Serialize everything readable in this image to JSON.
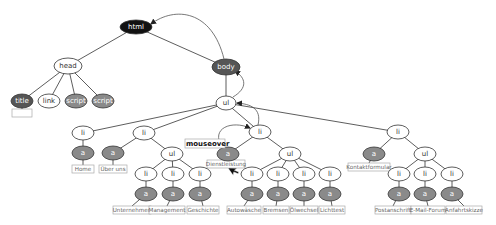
{
  "diagram": {
    "colors": {
      "black": "#111111",
      "dark": "#555555",
      "mid": "#8a8a8a",
      "light": "#ffffff",
      "edge": "#333333",
      "arrow": "#555555",
      "box_border": "#aaaaaa"
    },
    "nodes": [
      {
        "id": "html",
        "label": "html",
        "x": 136,
        "y": 27,
        "rx": 16,
        "ry": 7,
        "fill": "black"
      },
      {
        "id": "head",
        "label": "head",
        "x": 68,
        "y": 66,
        "rx": 14,
        "ry": 8,
        "fill": "light"
      },
      {
        "id": "body",
        "label": "body",
        "x": 226,
        "y": 67,
        "rx": 14,
        "ry": 8,
        "fill": "dark"
      },
      {
        "id": "title",
        "label": "title",
        "x": 22,
        "y": 101,
        "rx": 11,
        "ry": 7,
        "fill": "dark"
      },
      {
        "id": "link",
        "label": "link",
        "x": 49,
        "y": 101,
        "rx": 11,
        "ry": 7,
        "fill": "light"
      },
      {
        "id": "script1",
        "label": "script",
        "x": 76,
        "y": 101,
        "rx": 11,
        "ry": 7,
        "fill": "mid"
      },
      {
        "id": "script2",
        "label": "script",
        "x": 103,
        "y": 101,
        "rx": 11,
        "ry": 7,
        "fill": "mid"
      },
      {
        "id": "ul_main",
        "label": "ul",
        "x": 226,
        "y": 103,
        "rx": 10,
        "ry": 7,
        "fill": "light"
      },
      {
        "id": "li1",
        "label": "li",
        "x": 83,
        "y": 133,
        "rx": 11,
        "ry": 7,
        "fill": "light"
      },
      {
        "id": "li2",
        "label": "li",
        "x": 144,
        "y": 133,
        "rx": 11,
        "ry": 7,
        "fill": "light"
      },
      {
        "id": "li3",
        "label": "li",
        "x": 260,
        "y": 132,
        "rx": 11,
        "ry": 7,
        "fill": "light"
      },
      {
        "id": "li4",
        "label": "li",
        "x": 398,
        "y": 132,
        "rx": 11,
        "ry": 7,
        "fill": "light"
      },
      {
        "id": "a_home",
        "label": "a",
        "x": 83,
        "y": 153,
        "rx": 11,
        "ry": 7,
        "fill": "mid"
      },
      {
        "id": "a_ueber",
        "label": "a",
        "x": 113,
        "y": 153,
        "rx": 11,
        "ry": 7,
        "fill": "mid"
      },
      {
        "id": "ul2",
        "label": "ul",
        "x": 172,
        "y": 154,
        "rx": 11,
        "ry": 7,
        "fill": "light"
      },
      {
        "id": "a_dienst",
        "label": "a",
        "x": 228,
        "y": 154,
        "rx": 11,
        "ry": 7,
        "fill": "mid"
      },
      {
        "id": "ul3",
        "label": "ul",
        "x": 290,
        "y": 154,
        "rx": 11,
        "ry": 7,
        "fill": "light"
      },
      {
        "id": "a_kontakt",
        "label": "a",
        "x": 374,
        "y": 154,
        "rx": 11,
        "ry": 7,
        "fill": "mid"
      },
      {
        "id": "ul4",
        "label": "ul",
        "x": 425,
        "y": 154,
        "rx": 11,
        "ry": 7,
        "fill": "light"
      },
      {
        "id": "li_u1",
        "label": "li",
        "x": 146,
        "y": 174,
        "rx": 11,
        "ry": 7,
        "fill": "light"
      },
      {
        "id": "li_u2",
        "label": "li",
        "x": 173,
        "y": 174,
        "rx": 11,
        "ry": 7,
        "fill": "light"
      },
      {
        "id": "li_u3",
        "label": "li",
        "x": 200,
        "y": 174,
        "rx": 11,
        "ry": 7,
        "fill": "light"
      },
      {
        "id": "li_d1",
        "label": "li",
        "x": 252,
        "y": 174,
        "rx": 11,
        "ry": 7,
        "fill": "light"
      },
      {
        "id": "li_d2",
        "label": "li",
        "x": 278,
        "y": 174,
        "rx": 11,
        "ry": 7,
        "fill": "light"
      },
      {
        "id": "li_d3",
        "label": "li",
        "x": 304,
        "y": 174,
        "rx": 11,
        "ry": 7,
        "fill": "light"
      },
      {
        "id": "li_d4",
        "label": "li",
        "x": 330,
        "y": 174,
        "rx": 11,
        "ry": 7,
        "fill": "light"
      },
      {
        "id": "li_k1",
        "label": "li",
        "x": 399,
        "y": 174,
        "rx": 11,
        "ry": 7,
        "fill": "light"
      },
      {
        "id": "li_k2",
        "label": "li",
        "x": 425,
        "y": 174,
        "rx": 11,
        "ry": 7,
        "fill": "light"
      },
      {
        "id": "li_k3",
        "label": "li",
        "x": 452,
        "y": 174,
        "rx": 11,
        "ry": 7,
        "fill": "light"
      },
      {
        "id": "a_u1",
        "label": "a",
        "x": 146,
        "y": 194,
        "rx": 11,
        "ry": 7,
        "fill": "mid"
      },
      {
        "id": "a_u2",
        "label": "a",
        "x": 173,
        "y": 194,
        "rx": 11,
        "ry": 7,
        "fill": "mid"
      },
      {
        "id": "a_u3",
        "label": "a",
        "x": 200,
        "y": 194,
        "rx": 11,
        "ry": 7,
        "fill": "mid"
      },
      {
        "id": "a_d1",
        "label": "a",
        "x": 252,
        "y": 194,
        "rx": 11,
        "ry": 7,
        "fill": "mid"
      },
      {
        "id": "a_d2",
        "label": "a",
        "x": 278,
        "y": 194,
        "rx": 11,
        "ry": 7,
        "fill": "mid"
      },
      {
        "id": "a_d3",
        "label": "a",
        "x": 304,
        "y": 194,
        "rx": 11,
        "ry": 7,
        "fill": "mid"
      },
      {
        "id": "a_d4",
        "label": "a",
        "x": 330,
        "y": 194,
        "rx": 11,
        "ry": 7,
        "fill": "mid"
      },
      {
        "id": "a_k1",
        "label": "a",
        "x": 399,
        "y": 194,
        "rx": 11,
        "ry": 7,
        "fill": "mid"
      },
      {
        "id": "a_k2",
        "label": "a",
        "x": 425,
        "y": 194,
        "rx": 11,
        "ry": 7,
        "fill": "mid"
      },
      {
        "id": "a_k3",
        "label": "a",
        "x": 452,
        "y": 194,
        "rx": 11,
        "ry": 7,
        "fill": "mid"
      }
    ],
    "edges": [
      [
        "html",
        "head"
      ],
      [
        "html",
        "body"
      ],
      [
        "head",
        "title"
      ],
      [
        "head",
        "link"
      ],
      [
        "head",
        "script1"
      ],
      [
        "head",
        "script2"
      ],
      [
        "body",
        "ul_main"
      ],
      [
        "ul_main",
        "li1"
      ],
      [
        "ul_main",
        "li2"
      ],
      [
        "ul_main",
        "li3"
      ],
      [
        "ul_main",
        "li4"
      ],
      [
        "li1",
        "a_home"
      ],
      [
        "li2",
        "a_ueber"
      ],
      [
        "li2",
        "ul2"
      ],
      [
        "li3",
        "a_dienst"
      ],
      [
        "li3",
        "ul3"
      ],
      [
        "li4",
        "a_kontakt"
      ],
      [
        "li4",
        "ul4"
      ],
      [
        "ul2",
        "li_u1"
      ],
      [
        "ul2",
        "li_u2"
      ],
      [
        "ul2",
        "li_u3"
      ],
      [
        "ul3",
        "li_d1"
      ],
      [
        "ul3",
        "li_d2"
      ],
      [
        "ul3",
        "li_d3"
      ],
      [
        "ul3",
        "li_d4"
      ],
      [
        "ul4",
        "li_k1"
      ],
      [
        "ul4",
        "li_k2"
      ],
      [
        "ul4",
        "li_k3"
      ],
      [
        "li_u1",
        "a_u1"
      ],
      [
        "li_u2",
        "a_u2"
      ],
      [
        "li_u3",
        "a_u3"
      ],
      [
        "li_d1",
        "a_d1"
      ],
      [
        "li_d2",
        "a_d2"
      ],
      [
        "li_d3",
        "a_d3"
      ],
      [
        "li_d4",
        "a_d4"
      ],
      [
        "li_k1",
        "a_k1"
      ],
      [
        "li_k2",
        "a_k2"
      ],
      [
        "li_k3",
        "a_k3"
      ]
    ],
    "text_boxes": [
      {
        "parent": "title",
        "text": "",
        "x": 22,
        "y": 113,
        "w": 20
      },
      {
        "parent": "a_home",
        "text": "Home",
        "x": 83,
        "y": 169,
        "w": 22
      },
      {
        "parent": "a_ueber",
        "text": "Über uns",
        "x": 113,
        "y": 169,
        "w": 28
      },
      {
        "parent": "a_dienst",
        "text": "Dienstleistung",
        "x": 226,
        "y": 164,
        "w": 38
      },
      {
        "parent": "a_kontakt",
        "text": "Kontaktformular",
        "x": 369,
        "y": 167,
        "w": 42
      },
      {
        "parent": "a_u1",
        "text": "Unternehmen",
        "x": 132,
        "y": 210,
        "w": 38
      },
      {
        "parent": "a_u2",
        "text": "Management",
        "x": 167,
        "y": 210,
        "w": 36
      },
      {
        "parent": "a_u3",
        "text": "Geschichte",
        "x": 203,
        "y": 210,
        "w": 32
      },
      {
        "parent": "a_d1",
        "text": "Autowäsche",
        "x": 244,
        "y": 210,
        "w": 34
      },
      {
        "parent": "a_d2",
        "text": "Bremsen",
        "x": 276,
        "y": 210,
        "w": 26
      },
      {
        "parent": "a_d3",
        "text": "Ölwechsel",
        "x": 304,
        "y": 210,
        "w": 28
      },
      {
        "parent": "a_d4",
        "text": "Lichttest",
        "x": 332,
        "y": 210,
        "w": 26
      },
      {
        "parent": "a_k1",
        "text": "Postanschrift",
        "x": 393,
        "y": 210,
        "w": 36
      },
      {
        "parent": "a_k2",
        "text": "E-Mail-Forum",
        "x": 428,
        "y": 210,
        "w": 34
      },
      {
        "parent": "a_k3",
        "text": "Anfahrtskizze",
        "x": 464,
        "y": 210,
        "w": 36
      }
    ],
    "event_label": {
      "text": "mouseover",
      "x": 186,
      "y": 146
    },
    "bubble_arrows": [
      {
        "from": "a_dienst",
        "to": "li3",
        "path": "M222,147 C210,128 232,120 250,128"
      },
      {
        "from": "li3",
        "to": "ul_main",
        "path": "M258,125 C262,108 250,104 237,103"
      },
      {
        "from": "ul_main",
        "to": "body",
        "path": "M233,97 C248,88 246,78 235,71"
      },
      {
        "from": "body",
        "to": "html",
        "path": "M224,59 C212,10 175,6 151,24"
      }
    ],
    "cursor": {
      "x": 228,
      "y": 168
    }
  }
}
